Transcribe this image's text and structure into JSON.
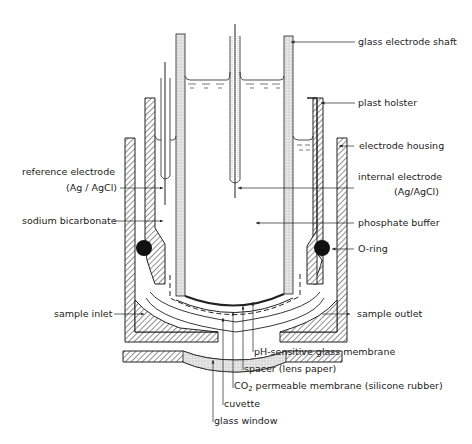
{
  "labels": {
    "glass_electrode_shaft": "glass electrode shaft",
    "plast_holster": "plast holster",
    "electrode_housing": "electrode housing",
    "reference_electrode_line1": "reference electrode",
    "reference_electrode_line2": "(Ag / AgCl)",
    "internal_electrode_line1": "internal electrode",
    "internal_electrode_line2": "(Ag/AgCl)",
    "sodium_bicarbonate": "sodium bicarbonate",
    "phosphate_buffer": "phosphate buffer",
    "o_ring": "O-ring",
    "sample_inlet": "sample inlet",
    "sample_outlet": "sample outlet",
    "ph_membrane": "pH-sensitive glass membrane",
    "spacer": "spacer (lens paper)",
    "co2_prefix": "CO",
    "co2_sub": "2",
    "co2_membrane": " permeable membrane (silicone rubber)",
    "cuvette": "cuvette",
    "glass_window": "glass window"
  },
  "colors": {
    "ink": "#222222",
    "stipple": "#d8d8d8"
  }
}
